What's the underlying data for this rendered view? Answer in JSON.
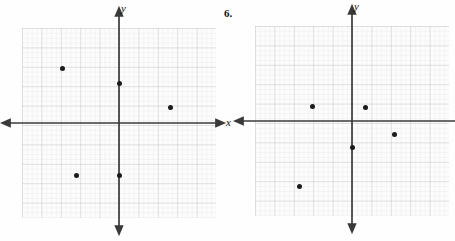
{
  "page": {
    "background_color": "#fefefe",
    "width": 455,
    "height": 241
  },
  "problem_number": {
    "label": "6.",
    "x": 224,
    "y": 8
  },
  "style": {
    "axis_color": "#3a3a3a",
    "point_color": "#1b1b1b",
    "grid_minor_color": "#e3e3e3",
    "grid_major_color": "#c9c9c9",
    "grid_background": "#fbfbfb"
  },
  "graphs": [
    {
      "id": "graph-left",
      "name": "coordinate-plane-left",
      "grid": {
        "left": 22,
        "top": 28,
        "width": 194,
        "height": 190,
        "minor_step": 4.85,
        "major_every": 4
      },
      "axes": {
        "origin_x": 119,
        "origin_y": 123,
        "x_axis_label": "x",
        "y_axis_label": "y",
        "x_label_x": 226,
        "x_label_y": 117,
        "y_label_x": 120,
        "y_label_y": 4,
        "x_start": 4,
        "x_end": 222,
        "y_start": 10,
        "y_end": 232
      },
      "points": [
        {
          "name": "point-1",
          "px": 62,
          "py": 68,
          "x": -3,
          "y": 3
        },
        {
          "name": "point-2",
          "px": 119,
          "py": 83,
          "x": 0,
          "y": 2
        },
        {
          "name": "point-3",
          "px": 170,
          "py": 107,
          "x": 2.5,
          "y": 0.8
        },
        {
          "name": "point-4",
          "px": 76,
          "py": 175,
          "x": -2,
          "y": -2.5
        },
        {
          "name": "point-5",
          "px": 119,
          "py": 175,
          "x": 0,
          "y": -2.5
        }
      ]
    },
    {
      "id": "graph-right",
      "name": "coordinate-plane-right",
      "grid": {
        "left": 22,
        "top": 28,
        "width": 194,
        "height": 190,
        "minor_step": 4.85,
        "major_every": 4
      },
      "axes": {
        "origin_x": 119,
        "origin_y": 121,
        "x_axis_label": "",
        "y_axis_label": "y",
        "x_label_x": 226,
        "x_label_y": 115,
        "y_label_x": 120,
        "y_label_y": 4,
        "x_start": 4,
        "x_end": 222,
        "y_start": 8,
        "y_end": 230
      },
      "points": [
        {
          "name": "point-1",
          "px": 79,
          "py": 106,
          "x": -2,
          "y": 0.8
        },
        {
          "name": "point-2",
          "px": 132,
          "py": 107,
          "x": 0.6,
          "y": 0.7
        },
        {
          "name": "point-3",
          "px": 161,
          "py": 134,
          "x": 2,
          "y": -0.7
        },
        {
          "name": "point-4",
          "px": 119,
          "py": 147,
          "x": 0,
          "y": -1.4
        },
        {
          "name": "point-5",
          "px": 66,
          "py": 186,
          "x": -2.8,
          "y": -3.4
        }
      ]
    }
  ]
}
